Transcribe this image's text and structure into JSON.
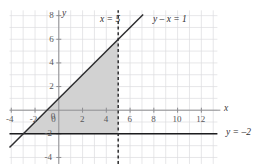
{
  "chart_data": {
    "type": "line",
    "title": "",
    "xlabel": "x",
    "ylabel": "y",
    "xlim": [
      -4.15,
      13.35
    ],
    "ylim": [
      -4.55,
      8.45
    ],
    "grid": true,
    "grid_step": 1,
    "legend_position": "inline-annotations",
    "x_ticks": [
      -4,
      -2,
      0,
      2,
      4,
      6,
      8,
      10,
      12
    ],
    "x_tick_labels": [
      "-4",
      "-2",
      "0",
      "2",
      "4",
      "6",
      "8",
      "10",
      "12"
    ],
    "y_ticks": [
      8,
      6,
      4,
      2,
      -2,
      -4
    ],
    "y_tick_labels": [
      "8",
      "6",
      "4",
      "2",
      "-2",
      "-4"
    ],
    "series": [
      {
        "name": "y - x = 1",
        "style": "solid",
        "color": "#2e2e30",
        "type": "line",
        "slope": 1,
        "intercept": 1,
        "x": [
          -4.15,
          7.1
        ],
        "values": [
          -3.15,
          8.1
        ],
        "label": "y – x = 1",
        "label_x": 7.0,
        "label_y": 7.6
      },
      {
        "name": "x = 5",
        "style": "dashed",
        "color": "#2e2e30",
        "type": "vertical-line",
        "x_value": 5,
        "x": [
          5,
          5
        ],
        "values": [
          -4.55,
          8.45
        ],
        "label": "x = 5",
        "label_x": 3.1,
        "label_y": 7.6
      },
      {
        "name": "y = -2",
        "style": "solid",
        "color": "#1d1d1f",
        "type": "horizontal-line",
        "y_value": -2,
        "x": [
          -4.15,
          13.35
        ],
        "values": [
          -2,
          -2
        ],
        "label": "y = –2",
        "label_x": 13.8,
        "label_y": -2
      }
    ],
    "shaded_region": {
      "name": "feasible-region",
      "fill": "#d2d2d2",
      "vertices": [
        [
          -3,
          -2
        ],
        [
          5,
          -2
        ],
        [
          5,
          6
        ]
      ],
      "description": "Triangle bounded by y - x = 1, x = 5 and y = -2"
    }
  },
  "labels": {
    "x_axis": "x",
    "y_axis": "y",
    "line_equation": "y – x = 1",
    "vertical_equation": "x = 5",
    "horizontal_equation": "y = –2"
  },
  "ticks": {
    "x": [
      "-4",
      "-2",
      "0",
      "2",
      "4",
      "6",
      "8",
      "10",
      "12"
    ],
    "y": [
      "8",
      "6",
      "4",
      "2",
      "-2",
      "-4"
    ]
  },
  "colors": {
    "background": "#ffffff",
    "grid": "#dcdce0",
    "axis": "#8e8e92",
    "curve": "#2e2e30",
    "shade": "#d2d2d2",
    "text": "#58585a"
  }
}
